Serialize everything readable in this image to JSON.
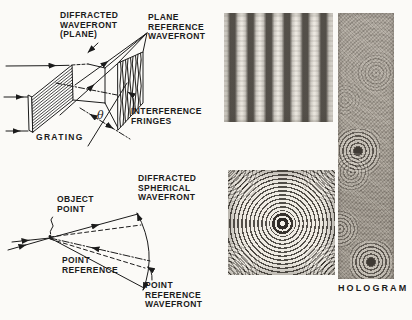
{
  "figure": {
    "ink_color": "#1b1b1b",
    "paper_color": "#fbfaf7"
  },
  "labels": {
    "diffracted_wavefront_plane": "DIFFRACTED\nWAVEFRONT\n(PLANE)",
    "plane_reference_wavefront": "PLANE\nREFERENCE\nWAVEFRONT",
    "interference_fringes": "INTERFERENCE\nFRINGES",
    "grating": "GRATING",
    "theta": "θ",
    "object_point": "OBJECT\nPOINT",
    "point_reference": "POINT\nREFERENCE",
    "diffracted_spherical_wavefront": "DIFFRACTED\nSPHERICAL\nWAVEFRONT",
    "point_reference_wavefront": "POINT\nREFERENCE\nWAVEFRONT",
    "hologram": "HOLOGRAM"
  }
}
